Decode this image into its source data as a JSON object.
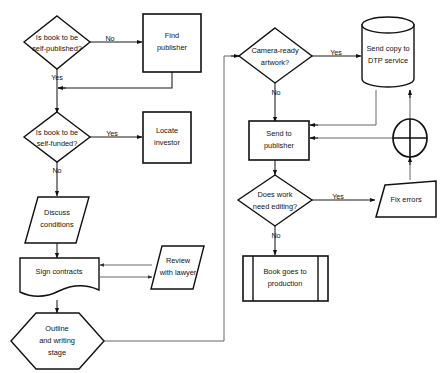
{
  "diagram": {
    "type": "flowchart",
    "colors": {
      "stroke": "#111111",
      "fill": "#ffffff",
      "connector": "#1a1a1a"
    },
    "nodes": [
      {
        "id": "n1",
        "shape": "decision",
        "name": "decision-self-published",
        "line1": "Is book to be",
        "line2": "self-published?",
        "line3": ""
      },
      {
        "id": "n2",
        "shape": "process",
        "name": "process-find-publisher",
        "line1": "Find",
        "line2": "publisher",
        "line3": ""
      },
      {
        "id": "n3",
        "shape": "decision",
        "name": "decision-self-funded",
        "line1": "Is book to be",
        "line2": "self-funded?",
        "line3": ""
      },
      {
        "id": "n4",
        "shape": "process",
        "name": "process-locate-investor",
        "line1": "Locate",
        "line2": "investor",
        "line3": ""
      },
      {
        "id": "n5",
        "shape": "parallelogram",
        "name": "data-discuss-conditions",
        "line1": "Discuss",
        "line2": "conditions",
        "line3": ""
      },
      {
        "id": "n6",
        "shape": "document",
        "name": "document-sign-contracts",
        "line1": "Sign contracts",
        "line2": "",
        "line3": ""
      },
      {
        "id": "n7",
        "shape": "parallelogram",
        "name": "data-review-with-lawyer",
        "line1": "Review",
        "line2": "with lawyer",
        "line3": ""
      },
      {
        "id": "n8",
        "shape": "hexagon",
        "name": "preparation-outline-writing-stage",
        "line1": "Outline",
        "line2": "and writing",
        "line3": "stage"
      },
      {
        "id": "n9",
        "shape": "decision",
        "name": "decision-camera-ready-artwork",
        "line1": "Camera-ready",
        "line2": "artwork?",
        "line3": ""
      },
      {
        "id": "n10",
        "shape": "cylinder",
        "name": "database-send-copy-dtp",
        "line1": "Send copy to",
        "line2": "DTP service",
        "line3": ""
      },
      {
        "id": "n11",
        "shape": "process",
        "name": "process-send-to-publisher",
        "line1": "Send to",
        "line2": "publisher",
        "line3": ""
      },
      {
        "id": "n12",
        "shape": "junction",
        "name": "junction-merge-circle",
        "line1": "",
        "line2": "",
        "line3": ""
      },
      {
        "id": "n13",
        "shape": "decision",
        "name": "decision-does-work-need-editing",
        "line1": "Does work",
        "line2": "need editing?",
        "line3": ""
      },
      {
        "id": "n14",
        "shape": "trapezoid",
        "name": "manual-operation-fix-errors",
        "line1": "Fix errors",
        "line2": "",
        "line3": ""
      },
      {
        "id": "n15",
        "shape": "predefined-process",
        "name": "predefined-process-book-goes-to-production",
        "line1": "Book goes to",
        "line2": "production",
        "line3": ""
      }
    ],
    "edge_labels": [
      {
        "id": "e1",
        "name": "edge-label-no-self-published",
        "text": "No"
      },
      {
        "id": "e2",
        "name": "edge-label-yes-self-published",
        "text": "Yes"
      },
      {
        "id": "e3",
        "name": "edge-label-yes-self-funded",
        "text": "Yes"
      },
      {
        "id": "e4",
        "name": "edge-label-no-self-funded",
        "text": "No"
      },
      {
        "id": "e5",
        "name": "edge-label-yes-camera-ready",
        "text": "Yes"
      },
      {
        "id": "e6",
        "name": "edge-label-no-camera-ready",
        "text": "No"
      },
      {
        "id": "e7",
        "name": "edge-label-yes-need-editing",
        "text": "Yes"
      },
      {
        "id": "e8",
        "name": "edge-label-no-need-editing",
        "text": "No"
      }
    ]
  }
}
